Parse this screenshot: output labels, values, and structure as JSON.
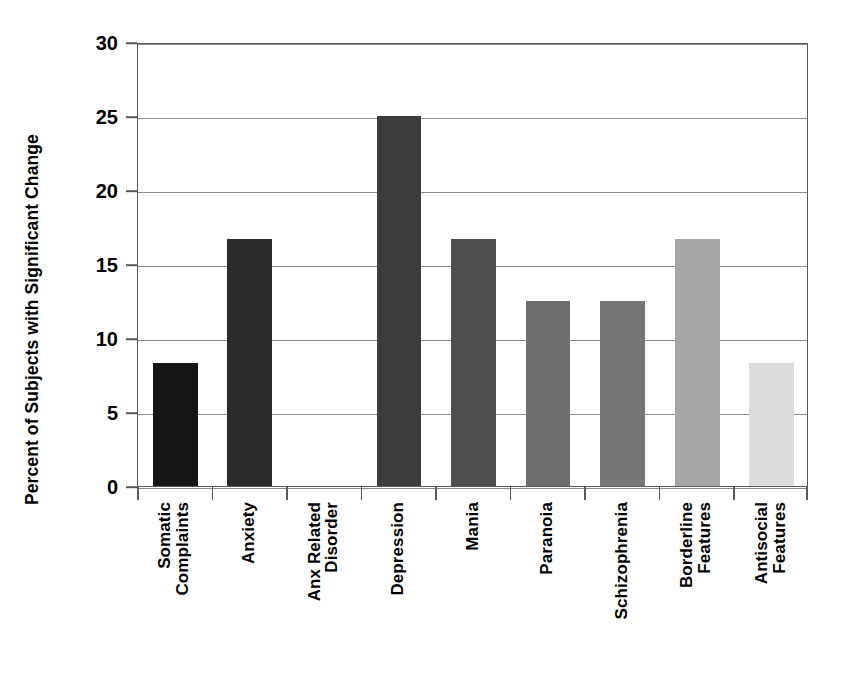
{
  "chart_data": {
    "type": "bar",
    "title": "",
    "xlabel": "",
    "ylabel": "Percent of Subjects with Significant Change",
    "ylim": [
      0,
      30
    ],
    "yticks": [
      0,
      5,
      10,
      15,
      20,
      25,
      30
    ],
    "ytick_labels": [
      "0",
      "5",
      "10",
      "15",
      "20",
      "25",
      "30"
    ],
    "grid": "horizontal",
    "legend": "none",
    "categories": [
      "Somatic Complaints",
      "Anxiety",
      "Anx Related Disorder",
      "Depression",
      "Mania",
      "Paranoia",
      "Schizophrenia",
      "Borderline Features",
      "Antisocial Features"
    ],
    "category_lines": [
      [
        "Somatic",
        "Complaints"
      ],
      [
        "Anxiety"
      ],
      [
        "Anx Related",
        "Disorder"
      ],
      [
        "Depression"
      ],
      [
        "Mania"
      ],
      [
        "Paranoia"
      ],
      [
        "Schizophrenia"
      ],
      [
        "Borderline",
        "Features"
      ],
      [
        "Antisocial",
        "Features"
      ]
    ],
    "values": [
      8.3,
      16.7,
      0,
      25.0,
      16.7,
      12.5,
      12.5,
      16.7,
      8.3
    ],
    "bar_colors": [
      "#151515",
      "#2b2b2b",
      "#333333",
      "#3c3c3c",
      "#4f4f4f",
      "#6e6e6e",
      "#767676",
      "#a6a6a6",
      "#dcdcdc"
    ],
    "axis_color": "#5a5a5a",
    "gridline_color": "#8a8a8a",
    "text_color": "#000000",
    "background_color": "#ffffff"
  }
}
